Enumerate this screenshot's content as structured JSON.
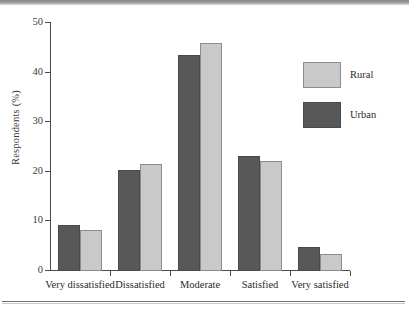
{
  "chart_data": {
    "type": "bar",
    "title": "",
    "xlabel": "",
    "ylabel": "Respondents (%)",
    "categories": [
      "Very dissatisfied",
      "Dissatisfied",
      "Moderate",
      "Satisfied",
      "Very satisfied"
    ],
    "series": [
      {
        "name": "Urban",
        "color": "#585858",
        "values": [
          9.2,
          20.4,
          43.5,
          23.2,
          4.8
        ]
      },
      {
        "name": "Rural",
        "color": "#c9c9c9",
        "values": [
          8.3,
          21.5,
          45.9,
          22.2,
          3.5
        ]
      }
    ],
    "ylim": [
      0,
      50
    ],
    "yticks": [
      0,
      10,
      20,
      30,
      40,
      50
    ],
    "ytick_labels": [
      "0",
      "10",
      "20",
      "30",
      "40",
      "50"
    ],
    "grid": false,
    "legend_position": "right",
    "legend_entries": [
      "Rural",
      "Urban"
    ],
    "bar_order_in_group": [
      "Urban",
      "Rural"
    ]
  }
}
